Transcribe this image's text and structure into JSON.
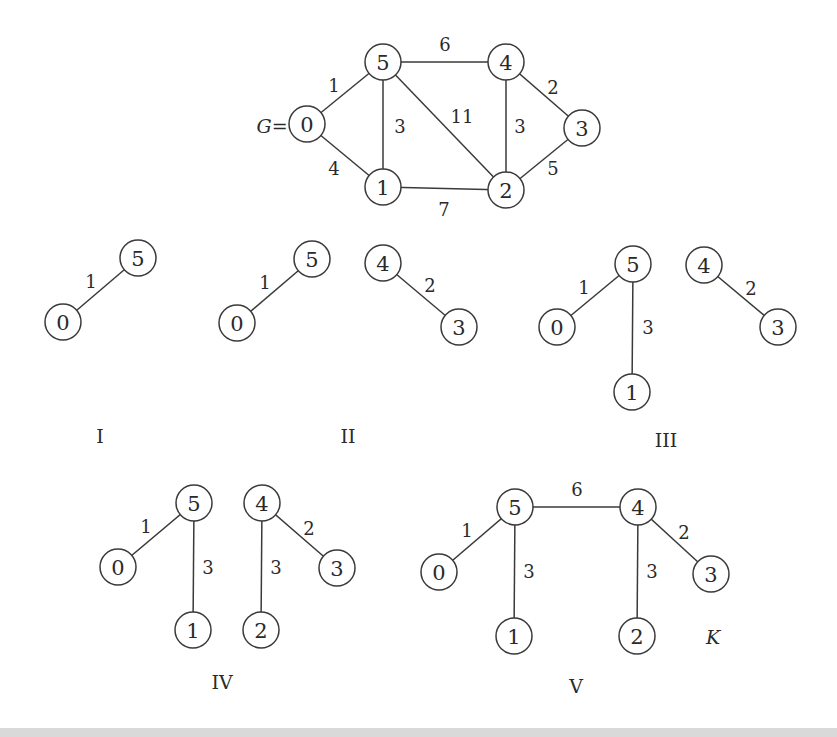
{
  "figure": {
    "title_label": "G=",
    "result_label": "K",
    "node_radius": 18,
    "colors": {
      "stroke": "#3a3a3a",
      "text": "#2a2a2a",
      "background": "#ffffff"
    }
  },
  "graphs": [
    {
      "id": "G",
      "caption": "",
      "nodes": [
        {
          "id": "0",
          "x": 307,
          "y": 124
        },
        {
          "id": "5",
          "x": 383,
          "y": 62
        },
        {
          "id": "4",
          "x": 506,
          "y": 62
        },
        {
          "id": "3",
          "x": 582,
          "y": 128
        },
        {
          "id": "2",
          "x": 506,
          "y": 190
        },
        {
          "id": "1",
          "x": 383,
          "y": 187
        }
      ],
      "edges": [
        {
          "from": "0",
          "to": "5",
          "weight": "1",
          "lx": 334,
          "ly": 85
        },
        {
          "from": "0",
          "to": "1",
          "weight": "4",
          "lx": 334,
          "ly": 168
        },
        {
          "from": "5",
          "to": "1",
          "weight": "3",
          "lx": 400,
          "ly": 126
        },
        {
          "from": "5",
          "to": "4",
          "weight": "6",
          "lx": 445,
          "ly": 44
        },
        {
          "from": "5",
          "to": "2",
          "weight": "11",
          "lx": 462,
          "ly": 116
        },
        {
          "from": "4",
          "to": "2",
          "weight": "3",
          "lx": 520,
          "ly": 126
        },
        {
          "from": "4",
          "to": "3",
          "weight": "2",
          "lx": 553,
          "ly": 87
        },
        {
          "from": "1",
          "to": "2",
          "weight": "7",
          "lx": 444,
          "ly": 209
        },
        {
          "from": "2",
          "to": "3",
          "weight": "5",
          "lx": 553,
          "ly": 168
        }
      ]
    },
    {
      "id": "I",
      "caption": "I",
      "caption_x": 100,
      "caption_y": 436,
      "nodes": [
        {
          "id": "0",
          "x": 63,
          "y": 322
        },
        {
          "id": "5",
          "x": 138,
          "y": 258
        }
      ],
      "edges": [
        {
          "from": "0",
          "to": "5",
          "weight": "1",
          "lx": 91,
          "ly": 281
        }
      ]
    },
    {
      "id": "II",
      "caption": "II",
      "caption_x": 348,
      "caption_y": 436,
      "nodes": [
        {
          "id": "0",
          "x": 237,
          "y": 323
        },
        {
          "id": "5",
          "x": 312,
          "y": 259
        },
        {
          "id": "4",
          "x": 383,
          "y": 263
        },
        {
          "id": "3",
          "x": 459,
          "y": 327
        }
      ],
      "edges": [
        {
          "from": "0",
          "to": "5",
          "weight": "1",
          "lx": 265,
          "ly": 282
        },
        {
          "from": "4",
          "to": "3",
          "weight": "2",
          "lx": 430,
          "ly": 285
        }
      ]
    },
    {
      "id": "III",
      "caption": "III",
      "caption_x": 666,
      "caption_y": 440,
      "nodes": [
        {
          "id": "0",
          "x": 557,
          "y": 327
        },
        {
          "id": "5",
          "x": 633,
          "y": 264
        },
        {
          "id": "1",
          "x": 632,
          "y": 392
        },
        {
          "id": "4",
          "x": 704,
          "y": 265
        },
        {
          "id": "3",
          "x": 778,
          "y": 327
        }
      ],
      "edges": [
        {
          "from": "0",
          "to": "5",
          "weight": "1",
          "lx": 584,
          "ly": 287
        },
        {
          "from": "5",
          "to": "1",
          "weight": "3",
          "lx": 648,
          "ly": 327
        },
        {
          "from": "4",
          "to": "3",
          "weight": "2",
          "lx": 751,
          "ly": 288
        }
      ]
    },
    {
      "id": "IV",
      "caption": "IV",
      "caption_x": 222,
      "caption_y": 682,
      "nodes": [
        {
          "id": "0",
          "x": 118,
          "y": 567
        },
        {
          "id": "5",
          "x": 194,
          "y": 503
        },
        {
          "id": "1",
          "x": 193,
          "y": 630
        },
        {
          "id": "4",
          "x": 262,
          "y": 503
        },
        {
          "id": "2",
          "x": 261,
          "y": 630
        },
        {
          "id": "3",
          "x": 337,
          "y": 568
        }
      ],
      "edges": [
        {
          "from": "0",
          "to": "5",
          "weight": "1",
          "lx": 146,
          "ly": 526
        },
        {
          "from": "5",
          "to": "1",
          "weight": "3",
          "lx": 208,
          "ly": 567
        },
        {
          "from": "4",
          "to": "2",
          "weight": "3",
          "lx": 276,
          "ly": 567
        },
        {
          "from": "4",
          "to": "3",
          "weight": "2",
          "lx": 309,
          "ly": 528
        }
      ]
    },
    {
      "id": "V",
      "caption": "V",
      "caption_x": 576,
      "caption_y": 686,
      "nodes": [
        {
          "id": "0",
          "x": 439,
          "y": 572
        },
        {
          "id": "5",
          "x": 515,
          "y": 507
        },
        {
          "id": "1",
          "x": 514,
          "y": 636
        },
        {
          "id": "4",
          "x": 638,
          "y": 507
        },
        {
          "id": "2",
          "x": 637,
          "y": 636
        },
        {
          "id": "3",
          "x": 711,
          "y": 574
        }
      ],
      "edges": [
        {
          "from": "0",
          "to": "5",
          "weight": "1",
          "lx": 467,
          "ly": 530
        },
        {
          "from": "5",
          "to": "1",
          "weight": "3",
          "lx": 529,
          "ly": 571
        },
        {
          "from": "5",
          "to": "4",
          "weight": "6",
          "lx": 577,
          "ly": 489
        },
        {
          "from": "4",
          "to": "2",
          "weight": "3",
          "lx": 652,
          "ly": 571
        },
        {
          "from": "4",
          "to": "3",
          "weight": "2",
          "lx": 684,
          "ly": 532
        }
      ]
    }
  ],
  "labels": {
    "g_equals": {
      "text": "G=",
      "x": 272,
      "y": 126
    },
    "k": {
      "text": "K",
      "x": 713,
      "y": 637
    }
  }
}
